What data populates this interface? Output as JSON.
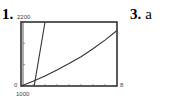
{
  "problems": [
    {
      "number": "1.",
      "label": "problem-1"
    },
    {
      "number": "3.",
      "answer": "a"
    }
  ],
  "chart_data": {
    "type": "line",
    "title": "",
    "xlabel": "",
    "ylabel": "",
    "window": {
      "xmin": 0,
      "xmax": 8,
      "ymin": 1000,
      "ymax": 2200
    },
    "tick_labels": {
      "ymax": "2200",
      "ymin_axis": "0",
      "ymin_below": "1000",
      "xmax": "8"
    },
    "x_ticks": [
      1,
      2,
      3,
      4,
      5,
      6,
      7
    ],
    "y_ticks": [
      1400,
      1800
    ],
    "series": [
      {
        "name": "steep linear",
        "x": [
          1.1,
          2.0
        ],
        "y": [
          1000,
          2200
        ]
      },
      {
        "name": "exponential curve",
        "x": [
          0,
          1,
          2,
          3,
          4,
          5,
          6,
          7,
          8
        ],
        "y": [
          1000,
          1090,
          1190,
          1300,
          1420,
          1550,
          1700,
          1860,
          2040
        ]
      }
    ],
    "grid": false,
    "legend": "none"
  }
}
